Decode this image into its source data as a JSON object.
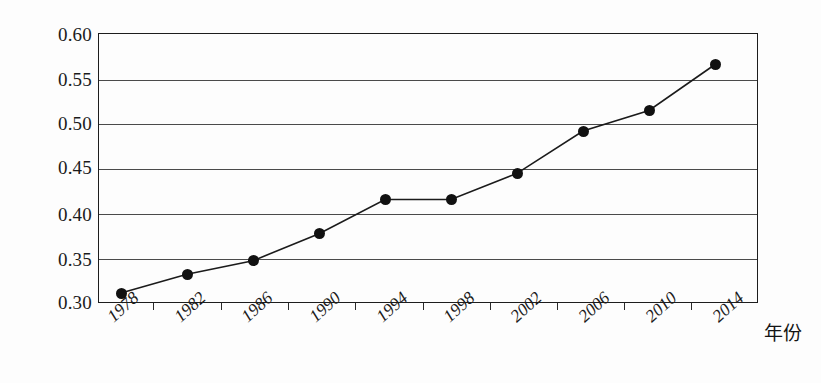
{
  "chart_data": {
    "type": "line",
    "title": "",
    "subtitle": "",
    "xlabel": "年份",
    "ylabel": "",
    "categories": [
      "1978",
      "1982",
      "1986",
      "1990",
      "1994",
      "1998",
      "2002",
      "2006",
      "2010",
      "2014"
    ],
    "x": [
      1978,
      1982,
      1986,
      1990,
      1994,
      1998,
      2002,
      2006,
      2010,
      2014
    ],
    "series": [
      {
        "name": "",
        "values": [
          0.311,
          0.332,
          0.347,
          0.377,
          0.415,
          0.415,
          0.444,
          0.491,
          0.514,
          0.565
        ]
      }
    ],
    "ylim": [
      0.3,
      0.6
    ],
    "ytick_labels": [
      "0.60",
      "0.55",
      "0.50",
      "0.45",
      "0.40",
      "0.35",
      "0.30"
    ],
    "ytick_values": [
      0.6,
      0.55,
      0.5,
      0.45,
      0.4,
      0.35,
      0.3
    ],
    "grid": true,
    "grid_axis": "y",
    "legend": false,
    "legend_position": "none",
    "marker": "filled-circle",
    "marker_color": "#111111",
    "line_color": "#1b1b1b",
    "frame_color": "#1d1d1d",
    "background": "#fdfdfd",
    "annotations": []
  }
}
